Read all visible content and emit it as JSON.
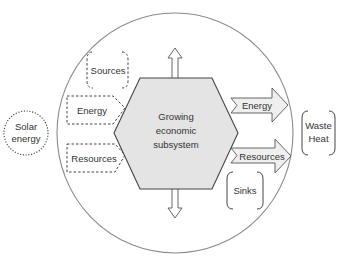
{
  "diagram": {
    "central": {
      "line1": "Growing",
      "line2": "economic",
      "line3": "subsystem"
    },
    "external": {
      "solar_line1": "Solar",
      "solar_line2": "energy",
      "waste_line1": "Waste",
      "waste_line2": "Heat"
    },
    "inputs": {
      "sources": "Sources",
      "energy": "Energy",
      "resources": "Resources"
    },
    "outputs": {
      "energy": "Energy",
      "resources": "Resources",
      "sinks": "Sinks"
    },
    "colors": {
      "stroke": "#555555",
      "hexagon_fill": "#e4e4e4",
      "arrow_fill": "#efefef",
      "circle_stroke": "#8a8a8a"
    }
  }
}
